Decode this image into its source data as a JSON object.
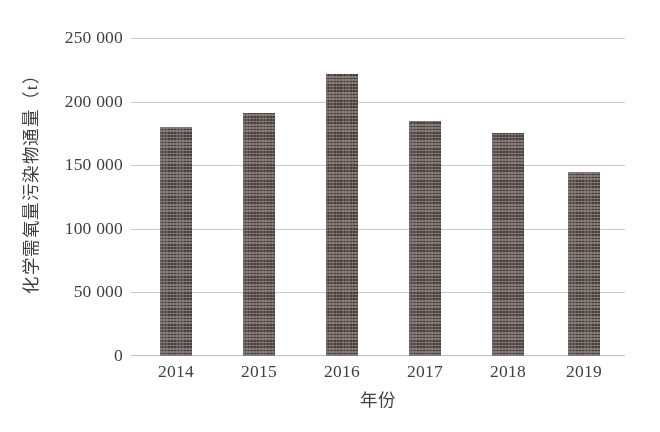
{
  "chart_data": {
    "type": "bar",
    "title": "",
    "xlabel": "年份",
    "ylabel": "化学需氧量污染物通量（t）",
    "categories": [
      "2014",
      "2015",
      "2016",
      "2017",
      "2018",
      "2019"
    ],
    "values": [
      180000,
      191000,
      222000,
      185000,
      175000,
      145000
    ],
    "series": [
      {
        "name": "化学需氧量污染物通量",
        "values": [
          180000,
          191000,
          222000,
          185000,
          175000,
          145000
        ]
      }
    ],
    "ylim": [
      0,
      250000
    ],
    "ytick_values": [
      0,
      50000,
      100000,
      150000,
      200000,
      250000
    ],
    "ytick_labels": [
      "0",
      "50 000",
      "100 000",
      "150 000",
      "200 000",
      "250 000"
    ],
    "grid": true,
    "legend": false,
    "legend_position": "none",
    "bar_color": "#473b36",
    "bar_pattern": "checkerboard",
    "gridline_color": "#c9c9c9",
    "background_color": "#ffffff",
    "units": "t"
  },
  "axes": {
    "y_title": "化学需氧量污染物通量（t）",
    "x_title": "年份"
  },
  "yticks": [
    {
      "label": "250 000",
      "value": 250000
    },
    {
      "label": "200 000",
      "value": 200000
    },
    {
      "label": "150 000",
      "value": 150000
    },
    {
      "label": "100 000",
      "value": 100000
    },
    {
      "label": "50 000",
      "value": 50000
    },
    {
      "label": "0",
      "value": 0
    }
  ],
  "xticks": [
    {
      "label": "2014"
    },
    {
      "label": "2015"
    },
    {
      "label": "2016"
    },
    {
      "label": "2017"
    },
    {
      "label": "2018"
    },
    {
      "label": "2019"
    }
  ]
}
